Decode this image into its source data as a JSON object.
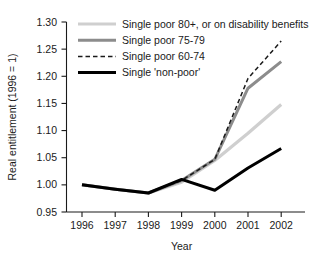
{
  "chart_data": {
    "type": "line",
    "title": "",
    "xlabel": "Year",
    "ylabel": "Real entitlement (1996 = 1)",
    "x": [
      1996,
      1997,
      1998,
      1999,
      2000,
      2001,
      2002
    ],
    "xticklabels": [
      "1996",
      "1997",
      "1998",
      "1999",
      "2000",
      "2001",
      "2002"
    ],
    "yticklabels": [
      "0.95",
      "1.00",
      "1.05",
      "1.10",
      "1.15",
      "1.20",
      "1.25",
      "1.30"
    ],
    "yticks": [
      0.95,
      1.0,
      1.05,
      1.1,
      1.15,
      1.2,
      1.25,
      1.3
    ],
    "xlim": [
      1995.7,
      1996.0
    ],
    "ylim": [
      0.95,
      1.3
    ],
    "grid": false,
    "legend_position": "top-left",
    "series": [
      {
        "name": "Single poor 80+, or on disability benefits",
        "color": "#cfcfcf",
        "style": "solid",
        "width": 3.2,
        "values": [
          1.0,
          0.992,
          0.985,
          1.005,
          1.045,
          1.095,
          1.148
        ]
      },
      {
        "name": "Single poor 75-79",
        "color": "#8c8c8c",
        "style": "solid",
        "width": 3.0,
        "values": [
          1.0,
          0.992,
          0.985,
          1.008,
          1.047,
          1.178,
          1.227
        ]
      },
      {
        "name": "Single poor 60-74",
        "color": "#1a1a1a",
        "style": "dashed",
        "width": 1.5,
        "values": [
          1.0,
          0.992,
          0.985,
          1.008,
          1.047,
          1.196,
          1.265
        ]
      },
      {
        "name": "Single 'non-poor'",
        "color": "#000000",
        "style": "solid",
        "width": 3.0,
        "values": [
          1.0,
          0.992,
          0.985,
          1.01,
          0.99,
          1.031,
          1.067
        ]
      }
    ]
  }
}
